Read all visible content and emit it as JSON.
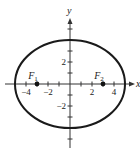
{
  "chart_data": {
    "type": "diagram",
    "title": "",
    "xlabel": "x",
    "ylabel": "y",
    "xlim": [
      -6,
      6
    ],
    "ylim": [
      -6,
      6
    ],
    "grid": false,
    "ellipse": {
      "equation": "x^2/25 + y^2/16 = 1",
      "center": [
        0,
        0
      ],
      "a": 5,
      "b": 4,
      "stroke": "#1a1a1a"
    },
    "x_ticks": [
      -5,
      -4,
      -3,
      -2,
      -1,
      1,
      2,
      3,
      4,
      5
    ],
    "y_ticks": [
      -5,
      -4,
      -3,
      -2,
      -1,
      1,
      2,
      3,
      4,
      5
    ],
    "x_tick_labels": [
      {
        "value": -4,
        "text": "−4"
      },
      {
        "value": -2,
        "text": "−2"
      },
      {
        "value": 2,
        "text": "2"
      },
      {
        "value": 4,
        "text": "4"
      }
    ],
    "y_tick_labels": [
      {
        "value": 2,
        "text": "2"
      },
      {
        "value": -2,
        "text": "−2"
      }
    ],
    "foci": [
      {
        "name": "F",
        "sub": "1",
        "x": -3,
        "y": 0
      },
      {
        "name": "F",
        "sub": "2",
        "x": 3,
        "y": 0
      }
    ]
  }
}
